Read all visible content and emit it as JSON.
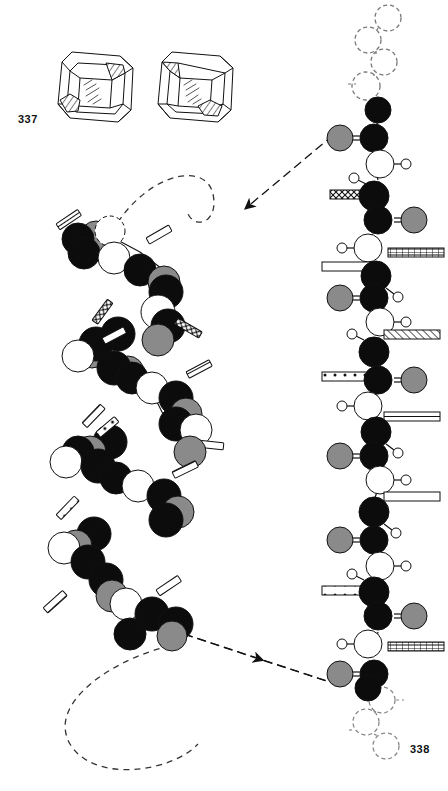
{
  "plate": {
    "caption_left": "337",
    "caption_right": "338",
    "background": "#ffffff",
    "ink": "#111111"
  },
  "crystals": {
    "name": "crystal-forms",
    "count": 2,
    "items": [
      {
        "label": "crystal-left",
        "x": 52,
        "y": 46,
        "w": 78,
        "h": 74
      },
      {
        "label": "crystal-right",
        "x": 152,
        "y": 46,
        "w": 78,
        "h": 74
      }
    ],
    "face_fill": "#ffffff",
    "hatch_fill": "#d8d8d8"
  },
  "molecule_colors": {
    "carbon": "#0c0c0c",
    "nitrogen": "#ffffff",
    "oxygen": "#8a8a8a",
    "hydrogen": "#ffffff",
    "outline": "#111111"
  },
  "legend_meaning": {
    "black_sphere": "carbon",
    "white_sphere": "nitrogen",
    "gray_sphere": "oxygen",
    "small_circle": "hydrogen",
    "hatched_bar": "side-chain-R-group"
  },
  "helix": {
    "name": "alpha-helix-model",
    "orientation": "vertical-coil",
    "turns": 5,
    "residue_count": 17,
    "terminus_dashed_circle": true,
    "trailing_dashed_curve": true,
    "residues": [
      {
        "i": 1,
        "cx": 82,
        "cy": 240,
        "bar": "lines",
        "bar_angle": -38
      },
      {
        "i": 2,
        "cx": 110,
        "cy": 253,
        "bar": null,
        "bar_angle": 0
      },
      {
        "i": 3,
        "cx": 140,
        "cy": 268,
        "bar": "plain",
        "bar_angle": -34
      },
      {
        "i": 4,
        "cx": 166,
        "cy": 288,
        "bar": "checker",
        "bar_angle": 38
      },
      {
        "i": 5,
        "cx": 120,
        "cy": 330,
        "bar": "checker",
        "bar_angle": -52
      },
      {
        "i": 6,
        "cx": 92,
        "cy": 352,
        "bar": null,
        "bar_angle": 0
      },
      {
        "i": 7,
        "cx": 118,
        "cy": 378,
        "bar": "plain",
        "bar_angle": -36
      },
      {
        "i": 8,
        "cx": 152,
        "cy": 392,
        "bar": "lines",
        "bar_angle": 36
      },
      {
        "i": 9,
        "cx": 104,
        "cy": 438,
        "bar": "lines",
        "bar_angle": -44
      },
      {
        "i": 10,
        "cx": 78,
        "cy": 455,
        "bar": null,
        "bar_angle": 0
      },
      {
        "i": 11,
        "cx": 112,
        "cy": 470,
        "bar": "dots",
        "bar_angle": -40
      },
      {
        "i": 12,
        "cx": 152,
        "cy": 486,
        "bar": "plain",
        "bar_angle": 12
      },
      {
        "i": 13,
        "cx": 96,
        "cy": 532,
        "bar": "dots",
        "bar_angle": -44
      },
      {
        "i": 14,
        "cx": 70,
        "cy": 556,
        "bar": null,
        "bar_angle": 0
      },
      {
        "i": 15,
        "cx": 100,
        "cy": 580,
        "bar": "lines",
        "bar_angle": -48
      },
      {
        "i": 16,
        "cx": 134,
        "cy": 608,
        "bar": "plain",
        "bar_angle": -34
      },
      {
        "i": 17,
        "cx": 160,
        "cy": 632,
        "bar": null,
        "bar_angle": 0
      }
    ]
  },
  "extended_chain": {
    "name": "extended-polypeptide-chain",
    "orientation": "vertical-zigzag",
    "top_dashed_residues": 4,
    "bottom_dashed_residues": 4,
    "residue_count": 9,
    "axis_x": 378,
    "residues": [
      {
        "i": 1,
        "cy": 112,
        "bar": null,
        "bar_side": "none",
        "oxygen_side": "left"
      },
      {
        "i": 2,
        "cy": 160,
        "bar": "checker",
        "bar_side": "left",
        "oxygen_side": "right"
      },
      {
        "i": 3,
        "cy": 207,
        "bar": "grid",
        "bar_side": "right",
        "oxygen_side": "left"
      },
      {
        "i": 4,
        "cy": 265,
        "bar": "plain",
        "bar_side": "left",
        "oxygen_side": "right"
      },
      {
        "i": 5,
        "cy": 310,
        "bar": "diag",
        "bar_side": "right",
        "oxygen_side": "left"
      },
      {
        "i": 6,
        "cy": 375,
        "bar": "dots",
        "bar_side": "left",
        "oxygen_side": "right"
      },
      {
        "i": 7,
        "cy": 420,
        "bar": "plain",
        "bar_side": "right",
        "oxygen_side": "left"
      },
      {
        "i": 8,
        "cy": 483,
        "bar": "diag",
        "bar_side": "left",
        "oxygen_side": "right"
      },
      {
        "i": 9,
        "cy": 530,
        "bar": "plain",
        "bar_side": "right",
        "oxygen_side": "left"
      },
      {
        "i": 10,
        "cy": 592,
        "bar": "dots",
        "bar_side": "left",
        "oxygen_side": "right"
      },
      {
        "i": 11,
        "cy": 638,
        "bar": "grid",
        "bar_side": "right",
        "oxygen_side": "left"
      }
    ]
  },
  "arrows": {
    "name": "pointer-arrows",
    "items": [
      {
        "label": "arrow-to-helix",
        "x1": 344,
        "y1": 128,
        "x2": 238,
        "y2": 214,
        "style": "dash-dot",
        "head": "end"
      },
      {
        "label": "arrow-to-chain",
        "x1": 182,
        "y1": 634,
        "x2": 330,
        "y2": 682,
        "style": "dash-dot",
        "head": "mid"
      }
    ]
  },
  "dashed_curves": {
    "name": "chain-continuation-curves",
    "top_curve": "M 118 225 C 150 175, 205 165, 212 195 C 218 222, 196 228, 190 214",
    "bottom_curve": "M 172 648 C 120 660, 52 700, 72 742 C 92 780, 170 770, 196 742"
  }
}
